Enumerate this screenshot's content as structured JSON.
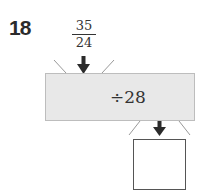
{
  "problem": {
    "number": "18",
    "input": {
      "numerator": "35",
      "denominator": "24"
    },
    "operation": "÷28",
    "answer": ""
  },
  "colors": {
    "machine_fill": "#e8e8e8",
    "arrow": "#2b2b2b"
  }
}
